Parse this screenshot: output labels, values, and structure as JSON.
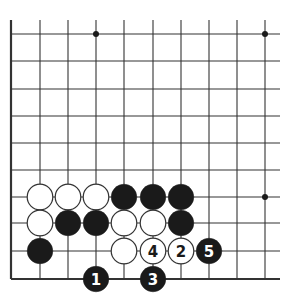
{
  "diagram": {
    "type": "go-board-fragment",
    "colors": {
      "background": "#ffffff",
      "line": "#333333",
      "black_stone": "#1a1a1a",
      "white_stone": "#ffffff",
      "white_outline": "#333333"
    },
    "grid": {
      "columns_x": [
        11,
        40,
        68,
        96,
        124,
        153,
        181,
        209,
        237,
        265
      ],
      "rows_y": [
        34,
        61,
        89,
        116,
        143,
        170,
        197,
        223,
        251,
        279
      ],
      "line_top": 20,
      "line_right_end": 280,
      "left_edge_is_board_edge": true,
      "bottom_edge_is_board_edge": true
    },
    "star_points": [
      {
        "col": 3,
        "row": 0
      },
      {
        "col": 9,
        "row": 0
      },
      {
        "col": 9,
        "row": 6
      }
    ],
    "stones": [
      {
        "col": 1,
        "row": 6,
        "color": "white",
        "label": ""
      },
      {
        "col": 2,
        "row": 6,
        "color": "white",
        "label": ""
      },
      {
        "col": 3,
        "row": 6,
        "color": "white",
        "label": ""
      },
      {
        "col": 4,
        "row": 6,
        "color": "black",
        "label": ""
      },
      {
        "col": 5,
        "row": 6,
        "color": "black",
        "label": ""
      },
      {
        "col": 6,
        "row": 6,
        "color": "black",
        "label": ""
      },
      {
        "col": 1,
        "row": 7,
        "color": "white",
        "label": ""
      },
      {
        "col": 2,
        "row": 7,
        "color": "black",
        "label": ""
      },
      {
        "col": 3,
        "row": 7,
        "color": "black",
        "label": ""
      },
      {
        "col": 4,
        "row": 7,
        "color": "white",
        "label": ""
      },
      {
        "col": 5,
        "row": 7,
        "color": "white",
        "label": ""
      },
      {
        "col": 6,
        "row": 7,
        "color": "black",
        "label": ""
      },
      {
        "col": 1,
        "row": 8,
        "color": "black",
        "label": ""
      },
      {
        "col": 4,
        "row": 8,
        "color": "white",
        "label": ""
      },
      {
        "col": 5,
        "row": 8,
        "color": "white",
        "label": "4"
      },
      {
        "col": 6,
        "row": 8,
        "color": "white",
        "label": "2"
      },
      {
        "col": 7,
        "row": 8,
        "color": "black",
        "label": "5"
      },
      {
        "col": 3,
        "row": 9,
        "color": "black",
        "label": "1"
      },
      {
        "col": 5,
        "row": 9,
        "color": "black",
        "label": "3"
      }
    ],
    "moves": [
      {
        "number": "1",
        "color": "black"
      },
      {
        "number": "2",
        "color": "white"
      },
      {
        "number": "3",
        "color": "black"
      },
      {
        "number": "4",
        "color": "white"
      },
      {
        "number": "5",
        "color": "black"
      }
    ]
  }
}
